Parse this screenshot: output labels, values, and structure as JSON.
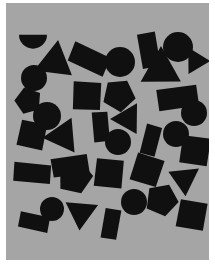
{
  "image": {
    "title": "Random black geometric shapes on gray field",
    "width": 215,
    "height": 267,
    "outer_background_color": "#ffffff",
    "panel_background_color": "#a5a5a5",
    "shape_fill_color": "#101010"
  },
  "panel": {
    "x": 6,
    "y": 3,
    "width": 203,
    "height": 257
  },
  "chart_data": {
    "type": "scatter",
    "xlabel": "",
    "ylabel": "",
    "xlim": [
      0,
      203
    ],
    "ylim": [
      0,
      257
    ],
    "grid": false,
    "legend": "none",
    "shape_counts": {
      "circle": 12,
      "square": 9,
      "triangle": 7,
      "pentagon": 5,
      "rectangle": 7,
      "semicircle": 1,
      "total": 41
    },
    "shapes": [
      {
        "id": 1,
        "kind": "semicircle",
        "cx": 27,
        "cy": 38,
        "r": 14,
        "rotation": 0,
        "label": "semicircle-top-left"
      },
      {
        "id": 2,
        "kind": "triangle",
        "cx": 49,
        "cy": 59,
        "r": 22,
        "rotation": 8,
        "label": "triangle-upper-left"
      },
      {
        "id": 3,
        "kind": "circle",
        "cx": 28,
        "cy": 75,
        "r": 13,
        "rotation": 0,
        "label": "circle-left-upper"
      },
      {
        "id": 4,
        "kind": "pentagon",
        "cx": 22,
        "cy": 98,
        "r": 14,
        "rotation": 200,
        "label": "pentagon-left-edge"
      },
      {
        "id": 5,
        "kind": "circle",
        "cx": 41,
        "cy": 113,
        "r": 14,
        "rotation": 0,
        "label": "circle-left-middle"
      },
      {
        "id": 6,
        "kind": "square",
        "cx": 26,
        "cy": 132,
        "r": 15,
        "rotation": 12,
        "label": "square-left-lower"
      },
      {
        "id": 7,
        "kind": "triangle",
        "cx": 57,
        "cy": 133,
        "r": 20,
        "rotation": 265,
        "label": "triangle-left-pointing"
      },
      {
        "id": 8,
        "kind": "rectangle",
        "cx": 26,
        "cy": 170,
        "r": 17,
        "rotation": 5,
        "label": "rectangle-lower-left"
      },
      {
        "id": 9,
        "kind": "circle",
        "cx": 46,
        "cy": 206,
        "r": 12,
        "rotation": 0,
        "label": "circle-bottom-left"
      },
      {
        "id": 10,
        "kind": "rectangle",
        "cx": 28,
        "cy": 219,
        "r": 14,
        "rotation": 12,
        "label": "rectangle-bottom-left"
      },
      {
        "id": 11,
        "kind": "rectangle",
        "cx": 83,
        "cy": 56,
        "r": 18,
        "rotation": 25,
        "label": "rectangle-top-middle"
      },
      {
        "id": 12,
        "kind": "square",
        "cx": 81,
        "cy": 93,
        "r": 16,
        "rotation": 3,
        "label": "square-center-upper"
      },
      {
        "id": 13,
        "kind": "rectangle",
        "cx": 95,
        "cy": 124,
        "r": 14,
        "rotation": 85,
        "label": "rectangle-center-vertical"
      },
      {
        "id": 14,
        "kind": "pentagon",
        "cx": 69,
        "cy": 174,
        "r": 18,
        "rotation": 15,
        "label": "pentagon-lower-center"
      },
      {
        "id": 15,
        "kind": "triangle",
        "cx": 75,
        "cy": 210,
        "r": 18,
        "rotation": 185,
        "label": "triangle-bottom-center-left"
      },
      {
        "id": 16,
        "kind": "rectangle",
        "cx": 64,
        "cy": 163,
        "r": 17,
        "rotation": 172,
        "label": "rectangle-mid-lower"
      },
      {
        "id": 17,
        "kind": "circle",
        "cx": 114,
        "cy": 59,
        "r": 15,
        "rotation": 0,
        "label": "circle-top-center"
      },
      {
        "id": 18,
        "kind": "pentagon",
        "cx": 113,
        "cy": 92,
        "r": 17,
        "rotation": 30,
        "label": "pentagon-center"
      },
      {
        "id": 19,
        "kind": "triangle",
        "cx": 122,
        "cy": 116,
        "r": 18,
        "rotation": 270,
        "label": "triangle-center-right"
      },
      {
        "id": 20,
        "kind": "circle",
        "cx": 112,
        "cy": 139,
        "r": 13,
        "rotation": 0,
        "label": "circle-center-lower"
      },
      {
        "id": 21,
        "kind": "square",
        "cx": 103,
        "cy": 170,
        "r": 16,
        "rotation": 6,
        "label": "square-center-bottom"
      },
      {
        "id": 22,
        "kind": "rectangle",
        "cx": 105,
        "cy": 221,
        "r": 14,
        "rotation": 100,
        "label": "rectangle-bottom-center"
      },
      {
        "id": 23,
        "kind": "rectangle",
        "cx": 143,
        "cy": 47,
        "r": 16,
        "rotation": 80,
        "label": "rectangle-top-right-vertical"
      },
      {
        "id": 24,
        "kind": "triangle",
        "cx": 155,
        "cy": 67,
        "r": 23,
        "rotation": 0,
        "label": "triangle-top-right-large"
      },
      {
        "id": 25,
        "kind": "circle",
        "cx": 172,
        "cy": 44,
        "r": 15,
        "rotation": 0,
        "label": "circle-top-right"
      },
      {
        "id": 26,
        "kind": "triangle",
        "cx": 190,
        "cy": 58,
        "r": 15,
        "rotation": 90,
        "label": "triangle-right-edge-top"
      },
      {
        "id": 27,
        "kind": "rectangle",
        "cx": 172,
        "cy": 95,
        "r": 19,
        "rotation": 172,
        "label": "rectangle-right-upper"
      },
      {
        "id": 28,
        "kind": "circle",
        "cx": 188,
        "cy": 110,
        "r": 13,
        "rotation": 0,
        "label": "circle-right-upper"
      },
      {
        "id": 29,
        "kind": "circle",
        "cx": 170,
        "cy": 131,
        "r": 13,
        "rotation": 0,
        "label": "circle-right-middle"
      },
      {
        "id": 30,
        "kind": "rectangle",
        "cx": 145,
        "cy": 137,
        "r": 14,
        "rotation": 105,
        "label": "rectangle-right-vertical"
      },
      {
        "id": 31,
        "kind": "square",
        "cx": 189,
        "cy": 148,
        "r": 16,
        "rotation": 8,
        "label": "square-right-middle"
      },
      {
        "id": 32,
        "kind": "square",
        "cx": 141,
        "cy": 167,
        "r": 16,
        "rotation": 18,
        "label": "square-center-right"
      },
      {
        "id": 33,
        "kind": "triangle",
        "cx": 178,
        "cy": 176,
        "r": 18,
        "rotation": 175,
        "label": "triangle-right-lower"
      },
      {
        "id": 34,
        "kind": "pentagon",
        "cx": 156,
        "cy": 197,
        "r": 17,
        "rotation": 25,
        "label": "pentagon-bottom-right"
      },
      {
        "id": 35,
        "kind": "square",
        "cx": 186,
        "cy": 212,
        "r": 16,
        "rotation": 10,
        "label": "square-bottom-right"
      },
      {
        "id": 36,
        "kind": "circle",
        "cx": 128,
        "cy": 199,
        "r": 13,
        "rotation": 0,
        "label": "circle-bottom-center-right"
      },
      {
        "id": 37,
        "kind": "circle",
        "cx": 138,
        "cy": 56,
        "r": 0,
        "rotation": 0,
        "label": "unused"
      },
      {
        "id": 38,
        "kind": "square",
        "cx": 47,
        "cy": 155,
        "r": 0,
        "rotation": 0,
        "label": "unused"
      },
      {
        "id": 39,
        "kind": "circle",
        "cx": 10,
        "cy": 150,
        "r": 0,
        "rotation": 0,
        "label": "unused"
      },
      {
        "id": 40,
        "kind": "square",
        "cx": 10,
        "cy": 150,
        "r": 0,
        "rotation": 0,
        "label": "unused"
      },
      {
        "id": 41,
        "kind": "circle",
        "cx": 10,
        "cy": 150,
        "r": 0,
        "rotation": 0,
        "label": "unused"
      }
    ]
  }
}
